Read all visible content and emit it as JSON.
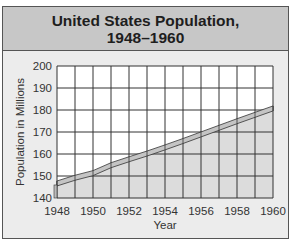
{
  "chart_data": {
    "type": "area",
    "title": "United States Population, 1948–1960",
    "title_line1": "United States Population,",
    "title_line2": "1948–1960",
    "xlabel": "Year",
    "ylabel": "Population in Millions",
    "x": [
      1948,
      1949,
      1950,
      1951,
      1952,
      1953,
      1954,
      1955,
      1956,
      1957,
      1958,
      1959,
      1960
    ],
    "values": [
      146.6,
      149.2,
      151.3,
      154.9,
      157.6,
      160.2,
      163.0,
      165.9,
      168.9,
      171.9,
      174.9,
      177.8,
      180.7
    ],
    "x_tick_labels": [
      "1948",
      "1950",
      "1952",
      "1954",
      "1956",
      "1958",
      "1960"
    ],
    "y_tick_labels": [
      "200",
      "190",
      "180",
      "170",
      "160",
      "150",
      "140"
    ],
    "ylim": [
      140,
      200
    ],
    "xlim": [
      1948,
      1960
    ],
    "grid": true,
    "legend": null,
    "colors": {
      "header_bg": "#c7c7c7",
      "panel_bg": "#ececec",
      "plot_bg": "#ffffff",
      "area_fill": "#dcdcdc",
      "ribbon_fill": "#c4c4c4",
      "grid": "#333333"
    }
  }
}
